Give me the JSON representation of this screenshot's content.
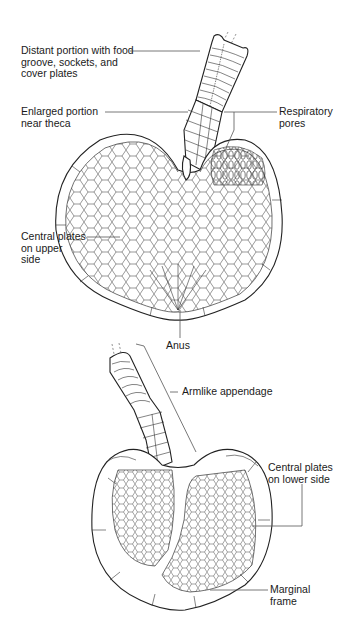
{
  "figure": {
    "top_view": {
      "labels": {
        "distant_portion": "Distant portion with food\ngroove, sockets, and\ncover plates",
        "enlarged_portion": "Enlarged portion\nnear theca",
        "respiratory_pores": "Respiratory\npores",
        "central_plates_upper": "Central plates\non upper\nside",
        "anus": "Anus"
      }
    },
    "bottom_view": {
      "labels": {
        "armlike_appendage": "Armlike appendage",
        "central_plates_lower": "Central plates\non lower side",
        "marginal_frame": "Marginal\nframe"
      }
    }
  }
}
